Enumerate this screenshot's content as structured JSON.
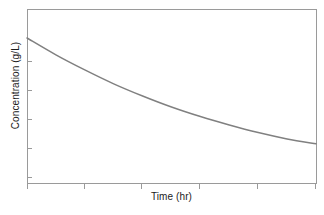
{
  "chart_data": {
    "type": "line",
    "title": "",
    "subtitle": "",
    "xlabel": "Time (hr)",
    "ylabel": "Concentration (g/L)",
    "grid": false,
    "legend": false,
    "legend_position": "none",
    "xlim": [
      0,
      5
    ],
    "ylim": [
      0,
      6
    ],
    "x_tick_labels": [
      "",
      "",
      "",
      "",
      "",
      ""
    ],
    "y_tick_labels": [
      "",
      "",
      "",
      "",
      ""
    ],
    "x_ticks": [
      0,
      1,
      2,
      3,
      4,
      5
    ],
    "y_ticks": [
      1,
      2,
      3,
      4,
      5
    ],
    "series": [
      {
        "name": "Concentration",
        "color": "#808080",
        "line_width": 1.5,
        "x": [
          0.0,
          0.5,
          1.0,
          1.5,
          2.0,
          2.5,
          3.0,
          3.5,
          4.0,
          4.5,
          5.0
        ],
        "y": [
          5.0,
          4.42,
          3.9,
          3.42,
          3.0,
          2.62,
          2.29,
          2.0,
          1.74,
          1.52,
          1.35
        ]
      }
    ],
    "annotations": []
  },
  "axes": {
    "frame_color": "#9a9a9a",
    "tick_color": "#9a9a9a",
    "x_title": "Time (hr)",
    "y_title": "Concentration (g/L)"
  },
  "figure": {
    "background": "#ffffff",
    "width": 324,
    "height": 215
  }
}
